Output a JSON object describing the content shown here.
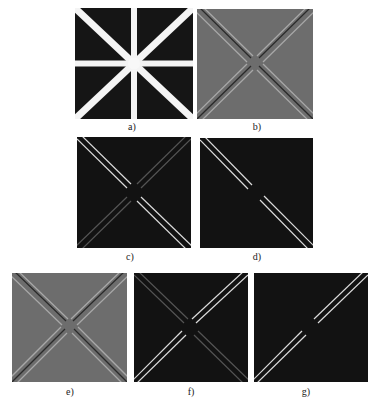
{
  "figure": {
    "panels": [
      {
        "id": "a",
        "label": "a)",
        "description": "binary input image with eight white bars radiating from center",
        "background": "#151515"
      },
      {
        "id": "b",
        "label": "b)",
        "description": "filter response on gray background, diagonal edges",
        "background": "#6d6d6d"
      },
      {
        "id": "c",
        "label": "c)",
        "description": "response magnitude, both diagonals, one bright",
        "background": "#121212"
      },
      {
        "id": "d",
        "label": "d)",
        "description": "single diagonal response with center gap",
        "background": "#121212"
      },
      {
        "id": "e",
        "label": "e)",
        "description": "filter response on gray background, opposite orientation",
        "background": "#6d6d6d"
      },
      {
        "id": "f",
        "label": "f)",
        "description": "response magnitude, both diagonals, other bright",
        "background": "#121212"
      },
      {
        "id": "g",
        "label": "g)",
        "description": "single anti-diagonal response with center gap",
        "background": "#121212"
      }
    ]
  }
}
